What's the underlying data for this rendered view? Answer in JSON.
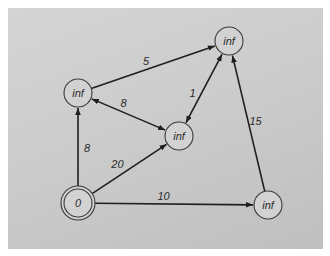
{
  "diagram": {
    "type": "directed-weighted-graph",
    "nodes": [
      {
        "id": "s",
        "label": "0",
        "start": true
      },
      {
        "id": "a",
        "label": "inf",
        "start": false
      },
      {
        "id": "b",
        "label": "inf",
        "start": false
      },
      {
        "id": "c",
        "label": "inf",
        "start": false
      },
      {
        "id": "d",
        "label": "inf",
        "start": false
      }
    ],
    "edges": [
      {
        "from": "s",
        "to": "a",
        "weight": "8",
        "bidirectional": false
      },
      {
        "from": "s",
        "to": "c",
        "weight": "20",
        "bidirectional": false
      },
      {
        "from": "s",
        "to": "d",
        "weight": "10",
        "bidirectional": false
      },
      {
        "from": "a",
        "to": "b",
        "weight": "5",
        "bidirectional": false
      },
      {
        "from": "a",
        "to": "c",
        "weight": "8",
        "bidirectional": true
      },
      {
        "from": "c",
        "to": "b",
        "weight": "1",
        "bidirectional": true
      },
      {
        "from": "d",
        "to": "b",
        "weight": "15",
        "bidirectional": false
      }
    ]
  }
}
